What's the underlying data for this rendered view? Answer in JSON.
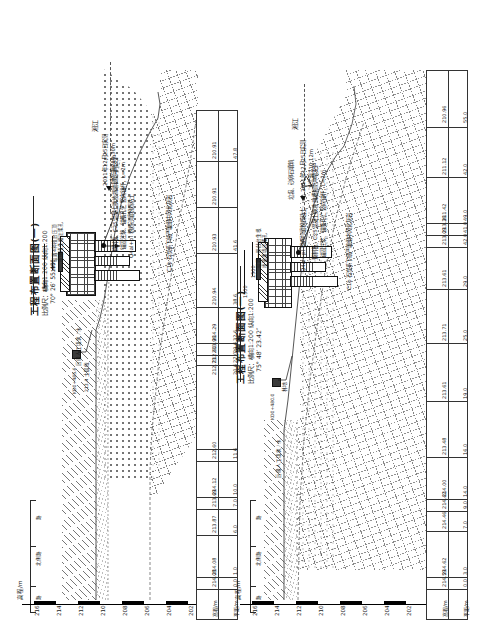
{
  "sheet": {
    "description": "工程布置断面图 CAD 图纸（图面整体逆时针旋转90°）"
  },
  "panels": [
    {
      "id": "left",
      "title": "工程布置断面图(一)",
      "scale": "比例尺：横向1:200  纵向1:200",
      "angle": "70° 26′ 55.49″",
      "station_label": "KD0+485.6",
      "slope_note": "设置4种植台压顶",
      "anchor_note": "喷播植生槽注浆孔",
      "road_labels": [
        "路",
        "北侧路",
        "路"
      ],
      "terrace_label": "后缘人工填筑 / 水",
      "terrace_value": "213.4 土层线",
      "annotations": [
        {
          "name": "anchor-detail",
          "text": "锚固注浆、锚筋孔位\n竖向锚杆，L=2m"
        },
        {
          "name": "grouting-detail",
          "text": "预制板、C25混凝土换坡\n挡墙和防冲墙支护"
        },
        {
          "name": "river-name",
          "text": "湘江"
        },
        {
          "name": "river-survey",
          "text": "2011年12月25日实测"
        },
        {
          "name": "river-level",
          "text": "水位高210.30m"
        },
        {
          "name": "geo-layer-q4",
          "text": "Q4al+pl 粉质砂壤粉质粘土"
        },
        {
          "name": "geo-layer-c1b",
          "text": "C1b 石炭系下统严塘组中风化灰岩"
        }
      ],
      "dims": [
        "1500",
        "1500"
      ],
      "elevation_axis": {
        "label": "高程/m",
        "ticks": [
          "216",
          "214",
          "212",
          "210",
          "208",
          "206",
          "204",
          "202"
        ]
      },
      "table": {
        "headers": [
          "高程/m",
          "平距/m"
        ],
        "rows": [
          {
            "elevation": "214.08",
            "distance": "0.0"
          },
          {
            "elevation": "214.08",
            "distance": "1.0"
          },
          {
            "elevation": "213.87",
            "distance": "6.0"
          },
          {
            "elevation": "213.69",
            "distance": "7.0"
          },
          {
            "elevation": "214.12",
            "distance": "10.0"
          },
          {
            "elevation": "212.60",
            "distance": "11.6"
          },
          {
            "elevation": "212.73",
            "distance": "20.6"
          },
          {
            "elevation": "212.60",
            "distance": "27.0"
          },
          {
            "elevation": "213.96",
            "distance": "29.6"
          },
          {
            "elevation": "214.29",
            "distance": "32.6"
          },
          {
            "elevation": "210.94",
            "distance": "38.6"
          },
          {
            "elevation": "210.93",
            "distance": "41.6"
          },
          {
            "elevation": "210.91",
            "distance": ""
          },
          {
            "elevation": "210.91",
            "distance": "47.8"
          }
        ]
      }
    },
    {
      "id": "right",
      "title": "工程布置断面图(一)",
      "scale": "比例尺：横向1:200  纵向1:200",
      "angle": "75° 48′ 23.42″",
      "station_label": "KD0+480.0",
      "slope_note": "设置一排戗台生根",
      "anchor_note": "喷锚垂墙注浆孔",
      "road_labels": [
        "路",
        "北侧路",
        "路"
      ],
      "terrace_label": "后缘人工填筑 / 水",
      "terrace_value": "林地",
      "annotations": [
        {
          "name": "anchor-detail",
          "text": "锚固注浆、锚筋孔位\n竖向锚杆，L=2m"
        },
        {
          "name": "grouting-detail",
          "text": "预制板、C25混凝土换坡\n挡槽和防冲墙支护"
        },
        {
          "name": "vegetation",
          "text": "垃圾、砂卵石填筑"
        },
        {
          "name": "river-name",
          "text": "湘江"
        },
        {
          "name": "river-survey",
          "text": "2011年12月25日实测"
        },
        {
          "name": "river-level",
          "text": "水位高210.12m"
        },
        {
          "name": "geo-layer-q4",
          "text": "Q4al+pl 粉质砂壤粉质粘土"
        },
        {
          "name": "geo-layer-c1b",
          "text": "C1b 石炭系下统严塘组中风化灰岩"
        }
      ],
      "dims": [
        "1500",
        "1500"
      ],
      "elevation_axis": {
        "label": "高程/m",
        "ticks": [
          "216",
          "214",
          "212",
          "210",
          "208",
          "206",
          "204",
          "202"
        ]
      },
      "table": {
        "headers": [
          "高程/m",
          "平距/m"
        ],
        "rows": [
          {
            "elevation": "214.59",
            "distance": "0.0"
          },
          {
            "elevation": "214.62",
            "distance": "3.0"
          },
          {
            "elevation": "214.46",
            "distance": "7.0"
          },
          {
            "elevation": "214.42",
            "distance": "9.0"
          },
          {
            "elevation": "214.00",
            "distance": "14.0"
          },
          {
            "elevation": "213.48",
            "distance": "16.0"
          },
          {
            "elevation": "213.61",
            "distance": "19.0"
          },
          {
            "elevation": "213.71",
            "distance": "25.0"
          },
          {
            "elevation": "213.61",
            "distance": "29.0"
          },
          {
            "elevation": "213.09",
            "distance": "42.0"
          },
          {
            "elevation": "213.36",
            "distance": "41.0"
          },
          {
            "elevation": "211.42",
            "distance": "49.0"
          },
          {
            "elevation": "211.12",
            "distance": "42.0"
          },
          {
            "elevation": "210.96",
            "distance": "55.0"
          }
        ]
      }
    }
  ],
  "colors": {
    "ink": "#1b1b1b",
    "line": "#333333",
    "geology": "#6a6a6a",
    "water": "#555555"
  }
}
